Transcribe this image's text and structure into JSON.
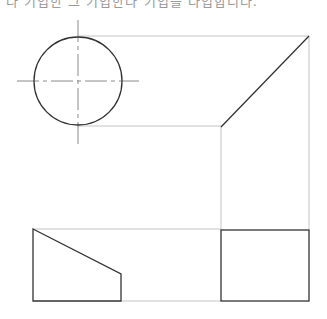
{
  "header": {
    "text": "다 기입한 그 기입한다 기입을 다입합니다."
  },
  "colors": {
    "object_line": "#333333",
    "projection_line": "#bdbdbd",
    "center_line": "#8a8a8a",
    "background": "#ffffff"
  },
  "top_view": {
    "shape": "circle",
    "center": [
      78,
      81
    ],
    "radius": 44
  },
  "miter_view": {
    "diagonal": [
      [
        309,
        36
      ],
      [
        221,
        127
      ]
    ]
  },
  "front_view": {
    "shape": "trapezoid",
    "points": [
      [
        33,
        229
      ],
      [
        121,
        274
      ],
      [
        121,
        301
      ],
      [
        33,
        301
      ]
    ]
  },
  "side_view": {
    "shape": "rectangle",
    "x": 221,
    "y": 230,
    "width": 88,
    "height": 71
  }
}
